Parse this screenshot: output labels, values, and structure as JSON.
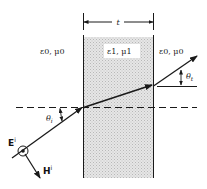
{
  "diagram": {
    "labels": {
      "thickness": "t",
      "left_medium": "ε0, μ0",
      "slab_medium": "ε1, μ1",
      "right_medium": "ε0, μ0",
      "incident_angle": "θi",
      "transmitted_angle": "θt",
      "e_field": "E",
      "e_field_sup": "i",
      "h_field": "H",
      "h_field_sup": "i"
    },
    "colors": {
      "slab_fill": "#d9d9d9",
      "stroke": "#1a1a1a"
    }
  }
}
